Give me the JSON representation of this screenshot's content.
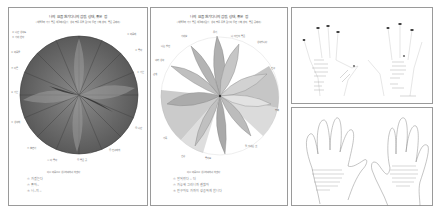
{
  "panels": [
    {
      "id": "mandala-dark",
      "title": "나의 요즘 환기다니의 감정, 상태, 좋은 점",
      "subtitle": "(색을 골라 가장 좋은 색깔에서 감정, 생각, 행동 등을, 감정이 들면 정해, 상의, 좋은 곳에 써)",
      "footer_title": "다시 마음으로 생활하며 하려 하겠다",
      "footer_items": [
        "① 가겠는다",
        "② 좋아~",
        "③ 너~지~"
      ],
      "style": "dark-filled-circle"
    },
    {
      "id": "mandala-flower",
      "title": "나의 요즘 환기다니의 감정, 상태, 좋은 점",
      "subtitle": "(색을 골라 가장 좋은 색깔에서 감정, 생각, 행동 등을, 감정이 들면 정해, 상의, 좋은 곳에 써)",
      "footer_title": "다시 마음으로 생활하며 하려 하겠다",
      "footer_items": [
        "① 잘되었다 ~ 더",
        "② 가능해 그러니까 괜찮아",
        "③ 친구와도 가까이 성공하게 합니다"
      ],
      "style": "petal-flower"
    },
    {
      "id": "hands-traced-top",
      "style": "two-hands-with-fingernails"
    },
    {
      "id": "hands-traced-bottom",
      "style": "two-hands-outline-with-text"
    }
  ],
  "colors": {
    "border": "#9a9a9a",
    "pencil_dark": "#4a4a4a",
    "pencil_mid": "#8a8a8a",
    "pencil_light": "#c4c4c4",
    "background": "#ffffff"
  }
}
